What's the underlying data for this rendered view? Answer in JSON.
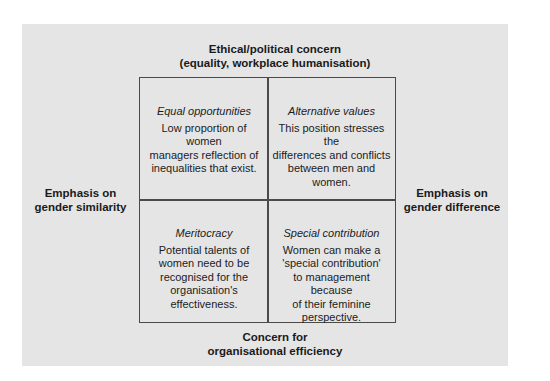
{
  "diagram": {
    "axes": {
      "top": {
        "line1": "Ethical/political concern",
        "line2": "(equality, workplace humanisation)"
      },
      "bottom": {
        "line1": "Concern for",
        "line2": "organisational efficiency"
      },
      "left": {
        "line1": "Emphasis on",
        "line2": "gender similarity"
      },
      "right": {
        "line1": "Emphasis on",
        "line2": "gender difference"
      }
    },
    "quadrants": [
      {
        "position": "top-left",
        "title": "Equal opportunities",
        "body": "Low proportion of women\nmanagers reflection of\ninequalities that exist."
      },
      {
        "position": "top-right",
        "title": "Alternative values",
        "body": "This position stresses the\ndifferences and conflicts\nbetween men and\nwomen."
      },
      {
        "position": "bottom-left",
        "title": "Meritocracy",
        "body": "Potential talents of\nwomen need to be\nrecognised for the\norganisation's\neffectiveness."
      },
      {
        "position": "bottom-right",
        "title": "Special contribution",
        "body": "Women can make a\n'special contribution'\nto management because\nof their feminine\nperspective."
      }
    ],
    "colors": {
      "panel_background": "#e5e5e5",
      "border": "#4a4a4a",
      "text": "#1c1c1c"
    }
  }
}
